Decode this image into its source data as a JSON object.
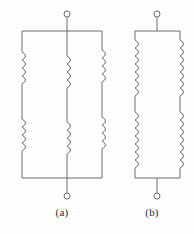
{
  "figure": {
    "kind": "electrical-schematic",
    "background_color": "#fdfdfc",
    "line_color": "#6e6e70",
    "label_color": "#2b2b2b",
    "width": 194,
    "height": 234
  },
  "circuits": [
    {
      "id": "a",
      "caption": "(a)",
      "terminal_top": {
        "cx": 67,
        "cy": 14,
        "r": 3
      },
      "terminal_bottom": {
        "cx": 67,
        "cy": 196,
        "r": 3
      },
      "rail_top_y": 31,
      "rail_bottom_y": 178,
      "rail_left_x": 22,
      "rail_right_x": 102,
      "branch_xs": [
        22,
        67,
        102
      ],
      "coil_turns_per_section": 4,
      "sections_per_branch": 2,
      "coil_side": "right",
      "coil_upper_y": [
        52,
        84
      ],
      "coil_lower_y": [
        119,
        151
      ]
    },
    {
      "id": "b",
      "caption": "(b)",
      "terminal_top": {
        "cx": 157,
        "cy": 14,
        "r": 3
      },
      "terminal_bottom": {
        "cx": 157,
        "cy": 196,
        "r": 3
      },
      "rail_top_y": 31,
      "rail_bottom_y": 178,
      "rail_left_x": 135,
      "rail_right_x": 180,
      "branch_xs": [
        135,
        180
      ],
      "coil_turns_per_section": 7,
      "sections_per_branch": 2,
      "coil_upper_y": [
        40,
        96
      ],
      "coil_lower_y": [
        112,
        168
      ]
    }
  ],
  "labels": {
    "a": "(a)",
    "b": "(b)"
  }
}
